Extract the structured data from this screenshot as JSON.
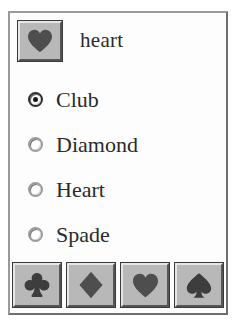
{
  "window": {
    "title": "",
    "background_color": "#fdfdfd",
    "frame_color": "#8a8a8a"
  },
  "display": {
    "button_name": "heart-display-button",
    "icon": "heart-icon",
    "label": "heart"
  },
  "radio_group": {
    "name": "suit-radio-group",
    "selected": "Club",
    "options": [
      {
        "label": "Club",
        "value": "club",
        "checked": true,
        "icon": "club-icon"
      },
      {
        "label": "Diamond",
        "value": "diamond",
        "checked": false,
        "icon": "diamond-icon"
      },
      {
        "label": "Heart",
        "value": "heart",
        "checked": false,
        "icon": "heart-icon"
      },
      {
        "label": "Spade",
        "value": "spade",
        "checked": false,
        "icon": "spade-icon"
      }
    ]
  },
  "toolbar": {
    "name": "suit-button-toolbar",
    "buttons": [
      {
        "icon": "club-icon",
        "tooltip": "Club"
      },
      {
        "icon": "diamond-icon",
        "tooltip": "Diamond"
      },
      {
        "icon": "heart-icon",
        "tooltip": "Heart"
      },
      {
        "icon": "spade-icon",
        "tooltip": "Spade"
      }
    ]
  },
  "colors": {
    "button_face": "#b8b8b8",
    "button_highlight": "#e6e6e6",
    "button_shadow": "#555555",
    "glyph": "#4e4e4e",
    "text": "#2a2a2a"
  }
}
